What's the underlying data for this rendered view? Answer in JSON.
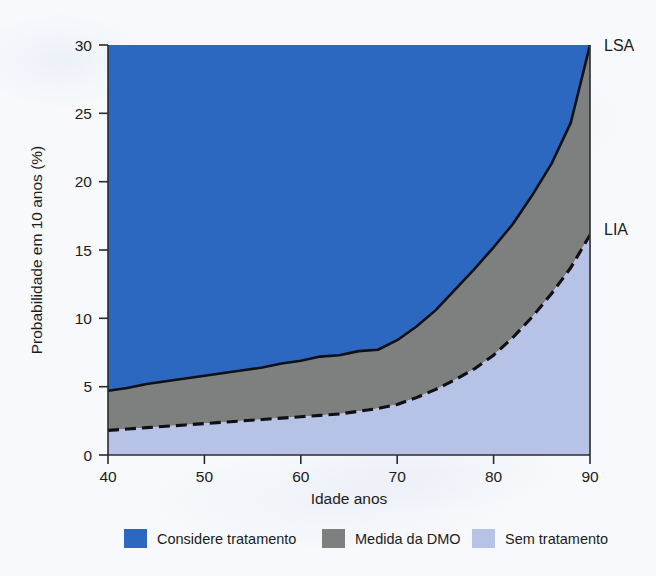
{
  "chart_data": {
    "type": "area",
    "title": "",
    "xlabel": "Idade anos",
    "ylabel": "Probabilidade em 10 anos (%)",
    "xlim": [
      40,
      90
    ],
    "ylim": [
      0,
      30
    ],
    "xticks": [
      40,
      50,
      60,
      70,
      80,
      90
    ],
    "yticks": [
      0,
      5,
      10,
      15,
      20,
      25,
      30
    ],
    "grid": false,
    "legend_position": "bottom",
    "x": [
      40,
      42,
      44,
      46,
      48,
      50,
      52,
      54,
      56,
      58,
      60,
      62,
      64,
      66,
      68,
      70,
      72,
      74,
      76,
      78,
      80,
      82,
      84,
      86,
      88,
      90
    ],
    "series": [
      {
        "name": "LSA",
        "style": "solid",
        "values": [
          4.7,
          4.9,
          5.2,
          5.4,
          5.6,
          5.8,
          6.0,
          6.2,
          6.4,
          6.7,
          6.9,
          7.2,
          7.3,
          7.6,
          7.7,
          8.4,
          9.4,
          10.6,
          12.1,
          13.6,
          15.2,
          16.9,
          19.0,
          21.3,
          24.3,
          30.0
        ]
      },
      {
        "name": "LIA",
        "style": "dashed",
        "values": [
          1.8,
          1.9,
          2.0,
          2.1,
          2.2,
          2.3,
          2.4,
          2.5,
          2.6,
          2.7,
          2.8,
          2.9,
          3.0,
          3.2,
          3.4,
          3.7,
          4.2,
          4.8,
          5.5,
          6.3,
          7.3,
          8.6,
          10.1,
          11.8,
          13.7,
          16.1
        ]
      }
    ],
    "bands": [
      {
        "name": "Considere tratamento",
        "region": "above LSA",
        "color": "#2c68c0"
      },
      {
        "name": "Medida da DMO",
        "region": "between LIA and LSA",
        "color": "#7e7f7f"
      },
      {
        "name": "Sem tratamento",
        "region": "below LIA",
        "color": "#b6c2e6"
      }
    ],
    "curve_labels": [
      {
        "text": "LSA",
        "at_x": 90,
        "at_y": 30
      },
      {
        "text": "LIA",
        "at_x": 90,
        "at_y": 16.1
      }
    ],
    "legend": [
      {
        "label": "Considere tratamento",
        "color": "#2c68c0"
      },
      {
        "label": "Medida da DMO",
        "color": "#7e7f7f"
      },
      {
        "label": "Sem tratamento",
        "color": "#b6c2e6"
      }
    ]
  },
  "colors": {
    "treat": "#2c68c0",
    "measure": "#7e7f7f",
    "no_treat": "#b6c2e6",
    "axis": "#2a2a2e",
    "text": "#1c1c20",
    "background": "#f7f9fc"
  }
}
